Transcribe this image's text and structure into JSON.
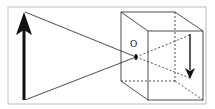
{
  "diagram": {
    "pinhole_label": "O",
    "colors": {
      "stroke": "#222222",
      "frame": "#bdbdbd",
      "background": "#ffffff"
    },
    "elements": [
      {
        "name": "object-arrow",
        "direction": "up"
      },
      {
        "name": "image-arrow",
        "direction": "down"
      },
      {
        "name": "camera-box",
        "shape": "cube"
      },
      {
        "name": "pinhole",
        "label": "O"
      }
    ]
  }
}
